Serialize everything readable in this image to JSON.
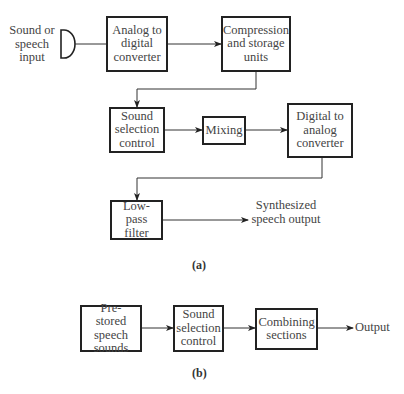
{
  "diagram_a": {
    "caption": "(a)",
    "input_label": "Sound or speech input",
    "input_icon": "microphone-icon",
    "blocks": {
      "adc": "Analog to digital converter",
      "compression": "Compression and storage units",
      "selection": "Sound selection control",
      "mixing": "Mixing",
      "dac": "Digital to analog converter",
      "lowpass": "Low-pass filter"
    },
    "output_label": "Synthesized speech output",
    "flow": [
      "Sound or speech input",
      "Analog to digital converter",
      "Compression and storage units",
      "Sound selection control",
      "Mixing",
      "Digital to analog converter",
      "Low-pass filter",
      "Synthesized speech output"
    ]
  },
  "diagram_b": {
    "caption": "(b)",
    "blocks": {
      "prestored": "Pre-stored speech sounds",
      "selection": "Sound selection control",
      "combining": "Combining sections"
    },
    "output_label": "Output",
    "flow": [
      "Pre-stored speech sounds",
      "Sound selection control",
      "Combining sections",
      "Output"
    ]
  }
}
